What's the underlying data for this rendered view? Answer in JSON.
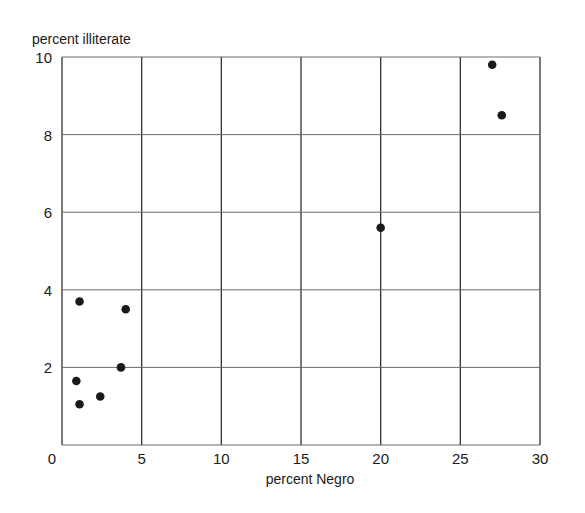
{
  "chart_data": {
    "type": "scatter",
    "title": "",
    "xlabel": "percent Negro",
    "ylabel": "percent illiterate",
    "xlim": [
      0,
      30
    ],
    "ylim": [
      0,
      10
    ],
    "xticks": [
      0,
      5,
      10,
      15,
      20,
      25,
      30
    ],
    "yticks": [
      2,
      4,
      6,
      8,
      10
    ],
    "ytick_labels_shown": [
      "2",
      "4",
      "6",
      "8",
      "10"
    ],
    "grid": true,
    "legend": null,
    "series": [
      {
        "name": "states",
        "points": [
          {
            "x": 1.1,
            "y": 3.7
          },
          {
            "x": 4.0,
            "y": 3.5
          },
          {
            "x": 3.7,
            "y": 2.0
          },
          {
            "x": 0.9,
            "y": 1.65
          },
          {
            "x": 2.4,
            "y": 1.25
          },
          {
            "x": 1.1,
            "y": 1.05
          },
          {
            "x": 20.0,
            "y": 5.6
          },
          {
            "x": 27.0,
            "y": 9.8
          },
          {
            "x": 27.6,
            "y": 8.5
          }
        ]
      }
    ]
  },
  "colors": {
    "ink": "#1a1a1a",
    "grid": "#333333",
    "background": "#ffffff"
  }
}
